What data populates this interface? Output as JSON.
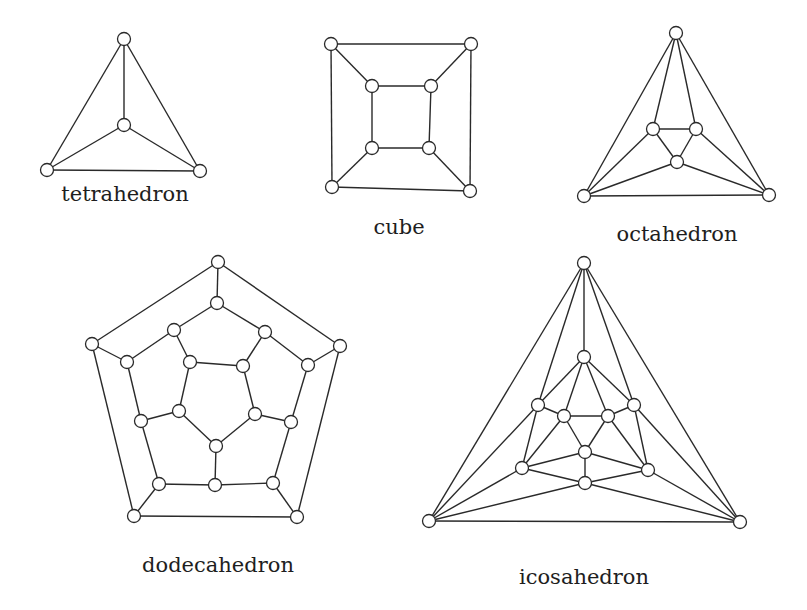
{
  "figure": {
    "node_radius": 6.5,
    "graphs": [
      {
        "name": "tetrahedron",
        "label": "tetrahedron",
        "label_pos": [
          125,
          182
        ],
        "nodes": [
          [
            124,
            39
          ],
          [
            124,
            125
          ],
          [
            47,
            170
          ],
          [
            200,
            171
          ]
        ],
        "edges": [
          [
            0,
            1
          ],
          [
            0,
            2
          ],
          [
            0,
            3
          ],
          [
            1,
            2
          ],
          [
            1,
            3
          ],
          [
            2,
            3
          ]
        ]
      },
      {
        "name": "cube",
        "label": "cube",
        "label_pos": [
          399,
          215
        ],
        "nodes": [
          [
            331,
            44
          ],
          [
            471,
            44
          ],
          [
            332,
            187
          ],
          [
            470,
            191
          ],
          [
            372,
            86
          ],
          [
            431,
            86
          ],
          [
            372,
            148
          ],
          [
            429,
            148
          ]
        ],
        "edges": [
          [
            0,
            1
          ],
          [
            1,
            3
          ],
          [
            3,
            2
          ],
          [
            2,
            0
          ],
          [
            4,
            5
          ],
          [
            5,
            7
          ],
          [
            7,
            6
          ],
          [
            6,
            4
          ],
          [
            0,
            4
          ],
          [
            1,
            5
          ],
          [
            2,
            6
          ],
          [
            3,
            7
          ]
        ]
      },
      {
        "name": "octahedron",
        "label": "octahedron",
        "label_pos": [
          677,
          222
        ],
        "nodes": [
          [
            676,
            33
          ],
          [
            653,
            129
          ],
          [
            696,
            129
          ],
          [
            677,
            162
          ],
          [
            584,
            196
          ],
          [
            769,
            195
          ]
        ],
        "edges": [
          [
            0,
            1
          ],
          [
            0,
            2
          ],
          [
            0,
            4
          ],
          [
            0,
            5
          ],
          [
            1,
            2
          ],
          [
            2,
            3
          ],
          [
            3,
            1
          ],
          [
            1,
            4
          ],
          [
            2,
            5
          ],
          [
            3,
            4
          ],
          [
            3,
            5
          ],
          [
            4,
            5
          ]
        ]
      },
      {
        "name": "dodecahedron",
        "label": "dodecahedron",
        "label_pos": [
          218,
          553
        ],
        "nodes": [
          [
            218,
            262
          ],
          [
            92,
            344
          ],
          [
            340,
            346
          ],
          [
            134,
            516
          ],
          [
            297,
            517
          ],
          [
            217,
            303
          ],
          [
            174,
            330
          ],
          [
            265,
            332
          ],
          [
            127,
            362
          ],
          [
            308,
            365
          ],
          [
            141,
            421
          ],
          [
            291,
            422
          ],
          [
            159,
            484
          ],
          [
            273,
            483
          ],
          [
            215,
            485
          ],
          [
            190,
            362
          ],
          [
            243,
            366
          ],
          [
            179,
            411
          ],
          [
            255,
            414
          ],
          [
            216,
            446
          ]
        ],
        "edges": [
          [
            0,
            1
          ],
          [
            0,
            2
          ],
          [
            1,
            3
          ],
          [
            2,
            4
          ],
          [
            3,
            4
          ],
          [
            0,
            5
          ],
          [
            1,
            8
          ],
          [
            2,
            9
          ],
          [
            3,
            12
          ],
          [
            4,
            13
          ],
          [
            5,
            6
          ],
          [
            5,
            7
          ],
          [
            6,
            8
          ],
          [
            7,
            9
          ],
          [
            8,
            10
          ],
          [
            9,
            11
          ],
          [
            10,
            12
          ],
          [
            11,
            13
          ],
          [
            12,
            14
          ],
          [
            13,
            14
          ],
          [
            6,
            15
          ],
          [
            7,
            16
          ],
          [
            10,
            17
          ],
          [
            11,
            18
          ],
          [
            14,
            19
          ],
          [
            15,
            16
          ],
          [
            16,
            18
          ],
          [
            18,
            19
          ],
          [
            19,
            17
          ],
          [
            17,
            15
          ]
        ]
      },
      {
        "name": "icosahedron",
        "label": "icosahedron",
        "label_pos": [
          584,
          565
        ],
        "nodes": [
          [
            584,
            263
          ],
          [
            429,
            521
          ],
          [
            740,
            522
          ],
          [
            584,
            357
          ],
          [
            538,
            405
          ],
          [
            634,
            405
          ],
          [
            564,
            416
          ],
          [
            608,
            416
          ],
          [
            585,
            452
          ],
          [
            522,
            468
          ],
          [
            648,
            470
          ],
          [
            585,
            483
          ]
        ],
        "edges": [
          [
            0,
            1
          ],
          [
            0,
            2
          ],
          [
            1,
            2
          ],
          [
            0,
            3
          ],
          [
            0,
            4
          ],
          [
            0,
            5
          ],
          [
            1,
            4
          ],
          [
            1,
            9
          ],
          [
            1,
            11
          ],
          [
            2,
            5
          ],
          [
            2,
            10
          ],
          [
            2,
            11
          ],
          [
            3,
            4
          ],
          [
            3,
            5
          ],
          [
            3,
            6
          ],
          [
            3,
            7
          ],
          [
            4,
            6
          ],
          [
            5,
            7
          ],
          [
            4,
            9
          ],
          [
            5,
            10
          ],
          [
            6,
            7
          ],
          [
            6,
            8
          ],
          [
            7,
            8
          ],
          [
            6,
            9
          ],
          [
            7,
            10
          ],
          [
            8,
            9
          ],
          [
            8,
            10
          ],
          [
            8,
            11
          ],
          [
            9,
            11
          ],
          [
            10,
            11
          ]
        ]
      }
    ]
  }
}
